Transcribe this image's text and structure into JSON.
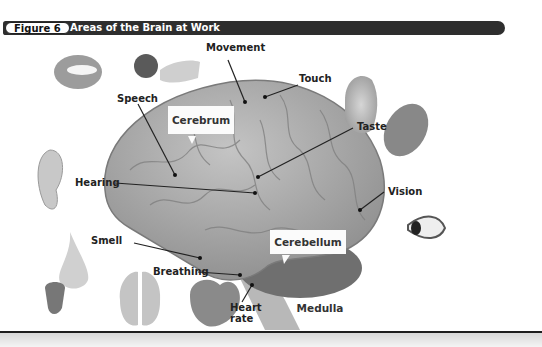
{
  "figure": {
    "number_label": "Figure 6",
    "title": "Areas of the Brain at Work"
  },
  "labels": {
    "movement": "Movement",
    "touch": "Touch",
    "speech": "Speech",
    "cerebrum": "Cerebrum",
    "taste": "Taste",
    "hearing": "Hearing",
    "vision": "Vision",
    "smell": "Smell",
    "cerebellum": "Cerebellum",
    "breathing": "Breathing",
    "heart_rate_line1": "Heart",
    "heart_rate_line2": "rate",
    "medulla": "Medulla"
  },
  "illustrations": [
    "mouth",
    "hand-with-ball",
    "cat-with-hand",
    "tongue",
    "ear",
    "eye",
    "nose",
    "flower-bud",
    "lungs",
    "heart",
    "brain"
  ],
  "colors": {
    "header_bg": "#2e2e2e",
    "brain": "#a9a9a9",
    "text": "#222222"
  }
}
